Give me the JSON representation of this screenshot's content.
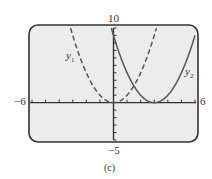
{
  "chart_data": {
    "type": "line",
    "title": "",
    "caption": "(c)",
    "xlabel": "",
    "ylabel": "",
    "xlim": [
      -6,
      6
    ],
    "ylim": [
      -5,
      10
    ],
    "x_tick_step": 1,
    "y_tick_step": 1,
    "grid": false,
    "window_labels": {
      "xmin": "-6",
      "xmax": "6",
      "ymin": "-5",
      "ymax": "10"
    },
    "series": [
      {
        "name": "y1",
        "label": "y₁",
        "expression": "x^2",
        "style": "dashed",
        "x": [
          -3,
          -2,
          -1,
          0,
          1,
          2,
          3
        ],
        "values": [
          9,
          4,
          1,
          0,
          1,
          4,
          9
        ]
      },
      {
        "name": "y2",
        "label": "y₂",
        "expression": "(x-3)^2",
        "style": "solid",
        "x": [
          0,
          1,
          2,
          3,
          4,
          5,
          6
        ],
        "values": [
          9,
          4,
          1,
          0,
          1,
          4,
          9
        ]
      }
    ]
  },
  "labels": {
    "xmin": "−6",
    "xmax": "6",
    "ymin": "−5",
    "ymax": "10",
    "y1": "y",
    "y1_sub": "1",
    "y2": "y",
    "y2_sub": "2",
    "caption": "(c)"
  },
  "colors": {
    "screen_bg": "#ececec",
    "screen_border": "#333333",
    "curve": "#555555"
  }
}
